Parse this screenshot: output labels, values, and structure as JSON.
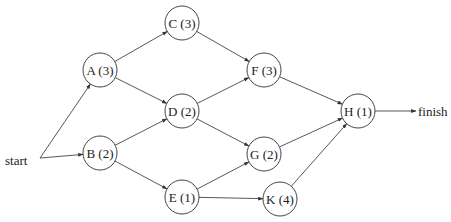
{
  "diagram": {
    "type": "activity-network",
    "start_label": "start",
    "finish_label": "finish",
    "nodes": [
      {
        "id": "A",
        "label": "A (3)",
        "duration": 3,
        "x": 100,
        "y": 70
      },
      {
        "id": "B",
        "label": "B (2)",
        "duration": 2,
        "x": 100,
        "y": 153
      },
      {
        "id": "C",
        "label": "C (3)",
        "duration": 3,
        "x": 182,
        "y": 23
      },
      {
        "id": "D",
        "label": "D (2)",
        "duration": 2,
        "x": 182,
        "y": 111
      },
      {
        "id": "E",
        "label": "E (1)",
        "duration": 1,
        "x": 182,
        "y": 197
      },
      {
        "id": "F",
        "label": "F (3)",
        "duration": 3,
        "x": 264,
        "y": 70
      },
      {
        "id": "G",
        "label": "G (2)",
        "duration": 2,
        "x": 264,
        "y": 154
      },
      {
        "id": "K",
        "label": "K (4)",
        "duration": 4,
        "x": 280,
        "y": 199
      },
      {
        "id": "H",
        "label": "H (1)",
        "duration": 1,
        "x": 358,
        "y": 111
      }
    ],
    "edges": [
      [
        "start",
        "A"
      ],
      [
        "start",
        "B"
      ],
      [
        "A",
        "C"
      ],
      [
        "A",
        "D"
      ],
      [
        "B",
        "D"
      ],
      [
        "B",
        "E"
      ],
      [
        "C",
        "F"
      ],
      [
        "D",
        "F"
      ],
      [
        "D",
        "G"
      ],
      [
        "E",
        "G"
      ],
      [
        "E",
        "K"
      ],
      [
        "F",
        "H"
      ],
      [
        "G",
        "H"
      ],
      [
        "K",
        "H"
      ],
      [
        "H",
        "finish"
      ]
    ]
  }
}
